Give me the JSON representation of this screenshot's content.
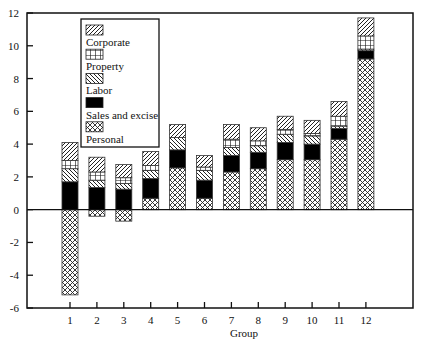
{
  "chart_data": {
    "type": "bar",
    "stacked": true,
    "title": "",
    "xlabel": "Group",
    "ylabel": "",
    "ylim": [
      -6,
      12
    ],
    "yticks": [
      -6,
      -4,
      -2,
      0,
      2,
      4,
      6,
      8,
      10,
      12
    ],
    "categories": [
      "1",
      "2",
      "3",
      "4",
      "5",
      "6",
      "7",
      "8",
      "9",
      "10",
      "11",
      "12"
    ],
    "grid": false,
    "legend_position": "upper-left-inside",
    "series": [
      {
        "name": "Personal",
        "pattern": "crosshatch",
        "values": [
          -5.2,
          -0.4,
          -0.7,
          0.7,
          2.55,
          0.7,
          2.3,
          2.5,
          3.05,
          3.05,
          4.3,
          9.2
        ]
      },
      {
        "name": "Sales and excise",
        "pattern": "solid-black",
        "values": [
          1.7,
          1.35,
          1.25,
          1.2,
          1.1,
          1.1,
          1.0,
          1.0,
          1.05,
          0.95,
          0.65,
          0.5
        ]
      },
      {
        "name": "Labor",
        "pattern": "diag-backslash",
        "values": [
          0.8,
          0.45,
          0.35,
          0.5,
          0.75,
          0.6,
          0.5,
          0.4,
          0.5,
          0.5,
          0.15,
          0.1
        ]
      },
      {
        "name": "Property",
        "pattern": "grid",
        "values": [
          0.5,
          0.5,
          0.35,
          0.3,
          0.0,
          0.2,
          0.5,
          0.3,
          0.3,
          0.15,
          0.6,
          0.8
        ]
      },
      {
        "name": "Corporate",
        "pattern": "diag-slash",
        "values": [
          1.1,
          0.9,
          0.8,
          0.85,
          0.8,
          0.7,
          0.9,
          0.8,
          0.8,
          0.8,
          0.9,
          1.1
        ]
      }
    ],
    "legend_order": [
      "Corporate",
      "Property",
      "Labor",
      "Sales and excise",
      "Personal"
    ]
  },
  "colors": {
    "axis": "#111111",
    "fill_dark": "#000000",
    "pattern_line": "#222222",
    "background": "#ffffff"
  }
}
